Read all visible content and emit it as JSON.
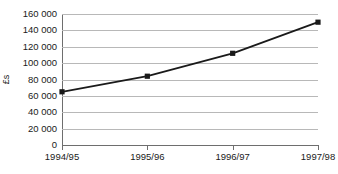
{
  "chart_data": {
    "type": "line",
    "title": "",
    "subtitle": "",
    "xlabel": "",
    "ylabel": "£s",
    "categories": [
      "1994/95",
      "1995/96",
      "1996/97",
      "1997/98"
    ],
    "values": [
      65000,
      84000,
      112000,
      150000
    ],
    "series": [
      {
        "name": "",
        "values": [
          65000,
          84000,
          112000,
          150000
        ]
      }
    ],
    "ylim": [
      0,
      160000
    ],
    "y_ticks": [
      0,
      20000,
      40000,
      60000,
      80000,
      100000,
      120000,
      140000,
      160000
    ],
    "y_tick_labels": [
      "0",
      "20 000",
      "40 000",
      "60 000",
      "80 000",
      "100 000",
      "120 000",
      "140 000",
      "160 000"
    ],
    "grid": true,
    "grid_axis": "y",
    "legend": false,
    "legend_position": "none",
    "marker": "square",
    "marker_color": "#1a1a1a",
    "line_color": "#1a1a1a",
    "gridline_color": "#b8b8b8",
    "axis_color": "#6e6e6e",
    "background_color": "#ffffff"
  }
}
